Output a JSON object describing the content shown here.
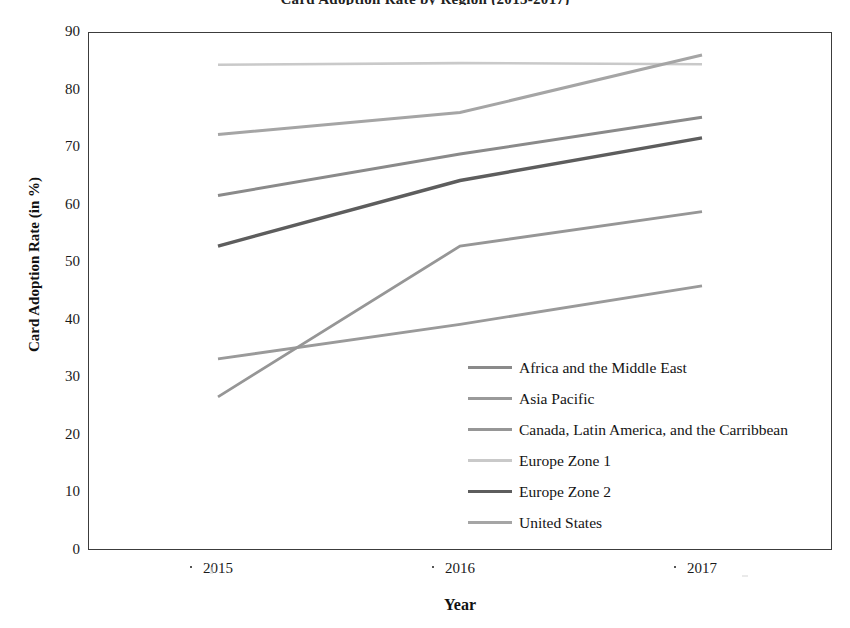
{
  "chart_data": {
    "type": "line",
    "title": "Card Adoption Rate by Region (2015-2017)",
    "xlabel": "Year",
    "ylabel": "Card Adoption Rate (in %)",
    "categories": [
      "2015",
      "2016",
      "2017"
    ],
    "x": [
      2015,
      2016,
      2017
    ],
    "ylim": [
      0,
      90
    ],
    "yticks": [
      90,
      80,
      70,
      60,
      50,
      40,
      30,
      20,
      10,
      0
    ],
    "xtick_labels": [
      "2015",
      "2016",
      "2017"
    ],
    "grid": false,
    "legend_position": "center-right-inside",
    "series": [
      {
        "name": "Africa and the Middle East",
        "values": [
          61.6,
          68.8,
          75.2
        ],
        "color": "#8a8a8a",
        "width": 3.0
      },
      {
        "name": "Asia Pacific",
        "values": [
          33.2,
          39.2,
          45.9
        ],
        "color": "#9a9a9a",
        "width": 2.8
      },
      {
        "name": "Canada, Latin America, and the Carribbean",
        "values": [
          26.6,
          52.8,
          58.8
        ],
        "color": "#969696",
        "width": 2.8
      },
      {
        "name": "Europe Zone 1",
        "values": [
          84.3,
          84.6,
          84.4
        ],
        "color": "#c9c9c9",
        "width": 2.6
      },
      {
        "name": "Europe Zone 2",
        "values": [
          52.8,
          64.2,
          71.6
        ],
        "color": "#5d5d5d",
        "width": 3.4
      },
      {
        "name": "United States",
        "values": [
          72.2,
          76.0,
          86.0
        ],
        "color": "#a5a5a5",
        "width": 3.0
      }
    ]
  },
  "axes": {
    "frame_color": "#3c3c3c"
  }
}
